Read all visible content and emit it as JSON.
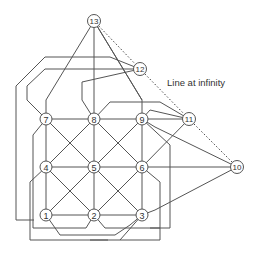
{
  "diagram": {
    "caption": "Line at infinity",
    "colors": {
      "line": "#555555",
      "node_stroke": "#555555",
      "node_fill": "#ffffff",
      "text": "#333333"
    },
    "nodes": [
      {
        "id": "1",
        "label": "1",
        "x": 46,
        "y": 215
      },
      {
        "id": "2",
        "label": "2",
        "x": 94,
        "y": 215
      },
      {
        "id": "3",
        "label": "3",
        "x": 142,
        "y": 215
      },
      {
        "id": "4",
        "label": "4",
        "x": 46,
        "y": 167
      },
      {
        "id": "5",
        "label": "5",
        "x": 94,
        "y": 167
      },
      {
        "id": "6",
        "label": "6",
        "x": 142,
        "y": 167
      },
      {
        "id": "7",
        "label": "7",
        "x": 46,
        "y": 119
      },
      {
        "id": "8",
        "label": "8",
        "x": 94,
        "y": 119
      },
      {
        "id": "9",
        "label": "9",
        "x": 142,
        "y": 119
      },
      {
        "id": "10",
        "label": "10",
        "x": 237,
        "y": 167
      },
      {
        "id": "11",
        "label": "11",
        "x": 189,
        "y": 119
      },
      {
        "id": "12",
        "label": "12",
        "x": 140,
        "y": 69
      },
      {
        "id": "13",
        "label": "13",
        "x": 94,
        "y": 21
      }
    ],
    "lines_at_infinity": [
      "13",
      "12",
      "11",
      "10"
    ]
  }
}
